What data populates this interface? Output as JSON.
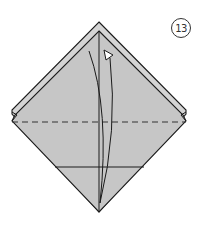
{
  "diagram": {
    "type": "origami-folding-step",
    "step_number": "13",
    "colors": {
      "paper_fill": "#c8c8c8",
      "back_layer_fill": "#d4d4d4",
      "line": "#1a1a1a",
      "arrow_head_fill": "#ffffff"
    },
    "elements": [
      {
        "name": "outer-diamond",
        "description": "back layer square rotated 45 degrees"
      },
      {
        "name": "inner-diamond",
        "description": "front layer flap, offset down"
      },
      {
        "name": "valley-fold-line",
        "style": "dashed",
        "orientation": "horizontal"
      },
      {
        "name": "crease-line",
        "style": "solid",
        "orientation": "horizontal"
      },
      {
        "name": "center-crease",
        "style": "solid",
        "orientation": "vertical"
      },
      {
        "name": "fold-up-arrow",
        "description": "curved arrow from bottom point up to top"
      }
    ]
  }
}
